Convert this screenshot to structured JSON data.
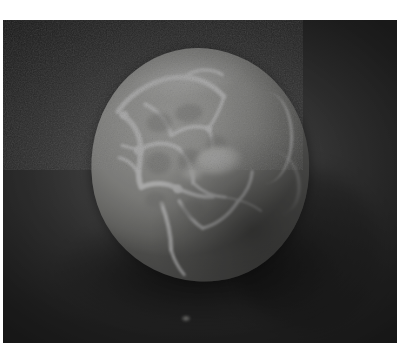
{
  "page": {
    "kind": "scanned-photograph",
    "width": 413,
    "height": 343,
    "background_color": "#ffffff",
    "caption": ""
  },
  "photo": {
    "name": "grayscale-photograph",
    "alt_text": "Black and white photograph of a pale ovoid egg-like object resting on a dark textured surface, with bright white web-like crack markings across its upper-left surface",
    "is_color": false,
    "border_color": "#ffffff",
    "frame": {
      "left": 3,
      "top": 20,
      "width": 394,
      "height": 323
    },
    "background": {
      "name": "dark-mottled-backdrop",
      "base_color": "#3b3b3b",
      "light_color": "#565656",
      "dark_color": "#2b2b2b",
      "texture": "halftone-dither"
    },
    "subject": {
      "name": "ovoid-object",
      "description": "egg-shaped pale object",
      "center_x": 200,
      "center_y": 165,
      "width": 218,
      "height": 234,
      "rotation_deg": -7,
      "base_color": "#c6c6c2",
      "highlight_color": "#d8d8d4",
      "shadow_color": "#6f6f6c"
    },
    "features": [
      {
        "name": "web-crack-markings",
        "description": "bright white irregular web network on upper-left quadrant",
        "color": "#ffffff"
      },
      {
        "name": "center-bright-blob",
        "description": "bright specular blob near the middle",
        "color": "#ffffff"
      },
      {
        "name": "right-rim-highlight",
        "description": "thin bright crescent along the right rim",
        "color": "#ffffff"
      },
      {
        "name": "cast-shadow",
        "description": "soft dark shadow below and right of the object",
        "color": "#000000"
      },
      {
        "name": "ground-speck",
        "description": "small bright speck on the surface near bottom-centre",
        "color": "#dcdcd7"
      }
    ]
  }
}
